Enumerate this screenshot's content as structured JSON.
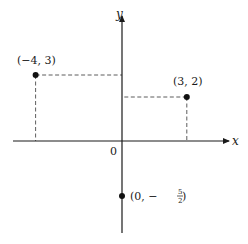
{
  "chart_data": {
    "type": "scatter",
    "title": "",
    "xlabel": "x",
    "ylabel": "y",
    "origin_label": "0",
    "xlim": [
      -5,
      5
    ],
    "ylim": [
      -4.3,
      5.8
    ],
    "grid": false,
    "points": [
      {
        "x": -4,
        "y": 3,
        "label": "(−4, 3)",
        "guides": true
      },
      {
        "x": 3,
        "y": 2,
        "label": "(3, 2)",
        "guides": true
      },
      {
        "x": 0,
        "y": -2.5,
        "label_prefix": "(0, −",
        "label_num": "5",
        "label_den": "2",
        "label_suffix": " )",
        "guides": false
      }
    ]
  }
}
